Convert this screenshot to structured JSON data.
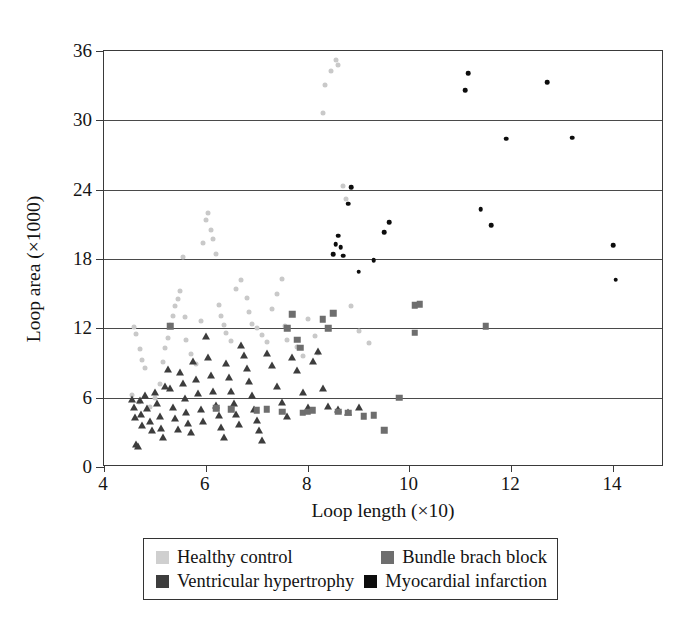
{
  "chart_data": {
    "type": "scatter",
    "title": "",
    "xlabel": "Loop length (×10)",
    "ylabel": "Loop area (×1000)",
    "xlim": [
      4,
      15
    ],
    "ylim": [
      0,
      36
    ],
    "xticks": [
      4,
      6,
      8,
      10,
      12,
      14
    ],
    "yticks": [
      0,
      6,
      12,
      18,
      24,
      30,
      36
    ],
    "grid": "horizontal",
    "legend_position": "below-axes",
    "series": [
      {
        "name": "Healthy control",
        "marker": "circle",
        "color": "#c9c9c9",
        "points": [
          [
            4.58,
            12.1
          ],
          [
            4.62,
            11.5
          ],
          [
            4.7,
            10.2
          ],
          [
            4.75,
            9.3
          ],
          [
            4.8,
            8.6
          ],
          [
            4.55,
            6.2
          ],
          [
            4.68,
            5.6
          ],
          [
            4.9,
            5.2
          ],
          [
            5.0,
            6.0
          ],
          [
            5.1,
            7.2
          ],
          [
            5.15,
            9.1
          ],
          [
            5.2,
            10.3
          ],
          [
            5.25,
            11.2
          ],
          [
            5.3,
            12.3
          ],
          [
            5.35,
            13.1
          ],
          [
            5.4,
            13.9
          ],
          [
            5.45,
            14.5
          ],
          [
            5.5,
            15.2
          ],
          [
            5.55,
            18.2
          ],
          [
            5.6,
            13.0
          ],
          [
            5.62,
            11.0
          ],
          [
            5.7,
            9.8
          ],
          [
            5.8,
            8.9
          ],
          [
            5.9,
            12.6
          ],
          [
            5.95,
            19.4
          ],
          [
            6.0,
            21.4
          ],
          [
            6.05,
            22.0
          ],
          [
            6.1,
            20.5
          ],
          [
            6.15,
            19.7
          ],
          [
            6.2,
            18.4
          ],
          [
            6.25,
            14.0
          ],
          [
            6.3,
            13.1
          ],
          [
            6.35,
            12.3
          ],
          [
            6.4,
            11.6
          ],
          [
            6.5,
            10.9
          ],
          [
            6.6,
            15.4
          ],
          [
            6.7,
            16.2
          ],
          [
            6.8,
            14.6
          ],
          [
            6.85,
            13.4
          ],
          [
            6.9,
            12.4
          ],
          [
            7.0,
            12.0
          ],
          [
            7.1,
            11.4
          ],
          [
            7.2,
            10.8
          ],
          [
            7.3,
            13.7
          ],
          [
            7.4,
            15.0
          ],
          [
            7.5,
            16.3
          ],
          [
            7.55,
            12.2
          ],
          [
            7.6,
            11.0
          ],
          [
            7.8,
            10.4
          ],
          [
            7.9,
            9.6
          ],
          [
            8.0,
            12.8
          ],
          [
            8.15,
            11.3
          ],
          [
            8.2,
            9.9
          ],
          [
            8.3,
            30.6
          ],
          [
            8.35,
            33.1
          ],
          [
            8.45,
            34.3
          ],
          [
            8.55,
            35.2
          ],
          [
            8.6,
            34.8
          ],
          [
            8.7,
            24.3
          ],
          [
            8.75,
            23.2
          ],
          [
            8.85,
            13.9
          ],
          [
            9.0,
            11.8
          ],
          [
            9.2,
            10.7
          ]
        ]
      },
      {
        "name": "Ventricular hypertrophy",
        "marker": "triangle",
        "color": "#3d3d3d",
        "points": [
          [
            4.55,
            5.9
          ],
          [
            4.58,
            5.2
          ],
          [
            4.6,
            4.3
          ],
          [
            4.62,
            2.0
          ],
          [
            4.66,
            1.8
          ],
          [
            4.7,
            5.8
          ],
          [
            4.72,
            4.6
          ],
          [
            4.75,
            3.6
          ],
          [
            4.8,
            6.2
          ],
          [
            4.85,
            5.1
          ],
          [
            4.9,
            4.0
          ],
          [
            4.95,
            3.2
          ],
          [
            5.0,
            6.5
          ],
          [
            5.05,
            5.5
          ],
          [
            5.1,
            4.4
          ],
          [
            5.12,
            3.4
          ],
          [
            5.15,
            2.6
          ],
          [
            5.2,
            7.0
          ],
          [
            5.25,
            8.5
          ],
          [
            5.3,
            6.8
          ],
          [
            5.35,
            5.2
          ],
          [
            5.4,
            4.2
          ],
          [
            5.45,
            3.3
          ],
          [
            5.5,
            8.2
          ],
          [
            5.55,
            7.3
          ],
          [
            5.6,
            6.0
          ],
          [
            5.62,
            4.8
          ],
          [
            5.65,
            3.8
          ],
          [
            5.7,
            3.0
          ],
          [
            5.75,
            9.2
          ],
          [
            5.8,
            7.6
          ],
          [
            5.85,
            6.4
          ],
          [
            5.9,
            5.0
          ],
          [
            5.95,
            4.0
          ],
          [
            6.0,
            11.3
          ],
          [
            6.05,
            9.5
          ],
          [
            6.1,
            8.0
          ],
          [
            6.15,
            6.6
          ],
          [
            6.2,
            5.4
          ],
          [
            6.25,
            4.5
          ],
          [
            6.3,
            3.5
          ],
          [
            6.35,
            2.6
          ],
          [
            6.4,
            9.0
          ],
          [
            6.45,
            7.8
          ],
          [
            6.5,
            6.6
          ],
          [
            6.55,
            5.5
          ],
          [
            6.6,
            4.6
          ],
          [
            6.65,
            3.7
          ],
          [
            6.7,
            10.6
          ],
          [
            6.75,
            9.7
          ],
          [
            6.8,
            8.6
          ],
          [
            6.85,
            7.4
          ],
          [
            6.9,
            6.2
          ],
          [
            6.95,
            5.0
          ],
          [
            7.0,
            4.1
          ],
          [
            7.05,
            3.2
          ],
          [
            7.1,
            2.3
          ],
          [
            7.2,
            9.9
          ],
          [
            7.3,
            8.8
          ],
          [
            7.4,
            7.0
          ],
          [
            7.5,
            5.6
          ],
          [
            7.6,
            4.4
          ],
          [
            7.7,
            9.5
          ],
          [
            7.8,
            8.4
          ],
          [
            7.9,
            6.5
          ],
          [
            8.0,
            5.2
          ],
          [
            8.1,
            9.2
          ],
          [
            8.2,
            10.0
          ],
          [
            8.3,
            6.8
          ],
          [
            8.4,
            5.3
          ],
          [
            8.6,
            5.0
          ],
          [
            8.8,
            4.8
          ],
          [
            9.0,
            5.2
          ]
        ]
      },
      {
        "name": "Bundle brach block",
        "marker": "square",
        "color": "#6e6e6e",
        "points": [
          [
            5.3,
            12.2
          ],
          [
            6.2,
            5.1
          ],
          [
            6.5,
            5.0
          ],
          [
            7.0,
            4.9
          ],
          [
            7.2,
            5.0
          ],
          [
            7.5,
            4.8
          ],
          [
            7.6,
            12.0
          ],
          [
            7.7,
            13.2
          ],
          [
            7.8,
            11.0
          ],
          [
            7.85,
            10.3
          ],
          [
            7.9,
            4.7
          ],
          [
            8.0,
            4.8
          ],
          [
            8.1,
            4.9
          ],
          [
            8.3,
            12.8
          ],
          [
            8.4,
            12.0
          ],
          [
            8.5,
            13.3
          ],
          [
            8.6,
            4.8
          ],
          [
            8.8,
            4.7
          ],
          [
            9.1,
            4.4
          ],
          [
            9.3,
            4.5
          ],
          [
            9.5,
            3.2
          ],
          [
            9.8,
            6.0
          ],
          [
            10.1,
            14.0
          ],
          [
            10.2,
            14.1
          ],
          [
            10.1,
            11.6
          ],
          [
            11.5,
            12.2
          ]
        ]
      },
      {
        "name": "Myocardial infarction",
        "marker": "circle-filled",
        "color": "#0d0d0d",
        "points": [
          [
            8.5,
            18.4
          ],
          [
            8.55,
            19.3
          ],
          [
            8.6,
            20.0
          ],
          [
            8.65,
            19.0
          ],
          [
            8.7,
            18.3
          ],
          [
            8.8,
            22.8
          ],
          [
            8.85,
            24.2
          ],
          [
            9.0,
            16.9
          ],
          [
            9.3,
            17.9
          ],
          [
            9.5,
            20.3
          ],
          [
            9.6,
            21.2
          ],
          [
            11.1,
            32.6
          ],
          [
            11.15,
            34.1
          ],
          [
            11.4,
            22.3
          ],
          [
            11.6,
            20.9
          ],
          [
            11.9,
            28.4
          ],
          [
            12.7,
            33.3
          ],
          [
            13.2,
            28.5
          ],
          [
            14.0,
            19.2
          ],
          [
            14.05,
            16.2
          ]
        ]
      }
    ]
  },
  "legend": {
    "entries": [
      {
        "label": "Healthy control",
        "color": "#cfcfcf"
      },
      {
        "label": "Bundle brach block",
        "color": "#6e6e6e"
      },
      {
        "label": "Ventricular hypertrophy",
        "color": "#3d3d3d"
      },
      {
        "label": "Myocardial infarction",
        "color": "#0d0d0d"
      }
    ]
  }
}
